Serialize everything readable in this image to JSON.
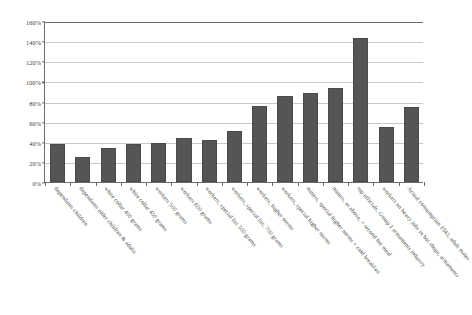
{
  "chart_data": {
    "type": "bar",
    "title": "",
    "subtitle": "",
    "xlabel": "",
    "ylabel": "",
    "ylim": [
      0,
      160
    ],
    "yunit": "%",
    "grid": true,
    "legend": false,
    "legend_position": "none",
    "bar_color": "#555555",
    "axis_color": "#6b6b6b",
    "gridline_color": "#c9c9c9",
    "ytick_labels": [
      "0%",
      "20%",
      "40%",
      "60%",
      "80%",
      "100%",
      "120%",
      "140%",
      "160%"
    ],
    "ytick_values": [
      0,
      20,
      40,
      60,
      80,
      100,
      120,
      140,
      160
    ],
    "categories": [
      "dependants children",
      "dependants older children & adults",
      "white collar 400 grams",
      "white collar 450 grams",
      "workers 500 grams",
      "workers 600 grams",
      "workers, special list 500 grams",
      "workers, special list, 700 grams",
      "workers, higher norms",
      "workers, special higher norms",
      "miners, special higher norms + cold breakfast",
      "miners, as above, + second hot meal",
      "top officials, Group 1 armaments industry",
      "workers on heavy jobs in hot shops, armaments",
      "Actual consumption 1943, adult males"
    ],
    "values": [
      38,
      25,
      34,
      38,
      39,
      44,
      42,
      51,
      76,
      85,
      88,
      93,
      143,
      55,
      75
    ]
  }
}
